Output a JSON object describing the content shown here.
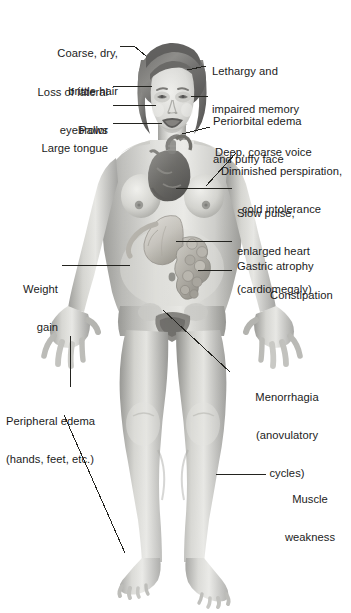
{
  "illustration": {
    "title": "Clinical manifestations of hypothyroidism (myxedema)",
    "subject": "adult female figure, anterior view, with internal organs exposed",
    "style": "grayscale medical illustration",
    "background_color": "#ffffff",
    "text_color": "#1b1b1b",
    "leader_line_color": "#23231f"
  },
  "labels": {
    "coarse_hair": {
      "line1": "Coarse, dry,",
      "line2": "brittle hair"
    },
    "eyebrows": {
      "line1": "Loss of lateral",
      "line2": "eyebrows"
    },
    "pallor": {
      "line1": "Pallor"
    },
    "tongue": {
      "line1": "Large tongue"
    },
    "lethargy": {
      "line1": "Lethargy and",
      "line2": "impaired memory"
    },
    "periorbital": {
      "line1": "Periorbital edema",
      "line2": "and puffy face"
    },
    "voice": {
      "line1": "Deep, coarse voice"
    },
    "perspiration": {
      "line1": "Diminished perspiration,",
      "line2": "cold intolerance"
    },
    "pulse": {
      "line1": "Slow pulse,",
      "line2": "enlarged heart",
      "line3": "(cardiomegaly)"
    },
    "gastric": {
      "line1": "Gastric atrophy"
    },
    "constipation": {
      "line1": "Constipation"
    },
    "weight": {
      "line1": "Weight",
      "line2": "gain"
    },
    "peripheral_edema": {
      "line1": "Peripheral edema",
      "line2": "(hands, feet, etc.)"
    },
    "menorrhagia": {
      "line1": "Menorrhagia",
      "line2": "(anovulatory",
      "line3": "cycles)"
    },
    "muscle": {
      "line1": "Muscle",
      "line2": "weakness"
    }
  },
  "anatomy_callouts": [
    "hair",
    "eyebrows",
    "face-skin",
    "tongue",
    "brain",
    "eyes",
    "larynx",
    "skin",
    "heart",
    "stomach",
    "intestines",
    "abdomen",
    "hands",
    "uterus",
    "legs"
  ]
}
